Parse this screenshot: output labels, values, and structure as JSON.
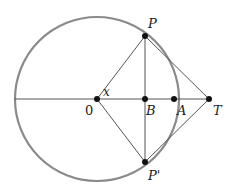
{
  "diagram": {
    "labels": {
      "center": "0",
      "P": "P",
      "P_prime": "P'",
      "B": "B",
      "A": "A",
      "T": "T",
      "angle": "x"
    },
    "colors": {
      "circle": "#8a8a8a",
      "lines": "#555555",
      "points": "#111111"
    }
  }
}
